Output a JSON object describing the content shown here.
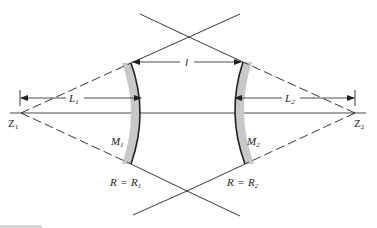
{
  "diagram": {
    "type": "optical resonator (two concave mirrors)",
    "labels": {
      "spacing": "l",
      "L1": "L",
      "L1_sub": "1",
      "L2": "L",
      "L2_sub": "2",
      "Z1": "Z",
      "Z1_sub": "1",
      "Z2": "Z",
      "Z2_sub": "2",
      "M1": "M",
      "M1_sub": "1",
      "M2": "M",
      "M2_sub": "2",
      "R1_left": "R",
      "R1_eq": "=",
      "R1_right": "R",
      "R1_sub": "1",
      "R2_left": "R",
      "R2_eq": "=",
      "R2_right": "R",
      "R2_sub": "2"
    },
    "colors": {
      "line": "#222222",
      "mirror_shade": "#c8c8c8",
      "background": "#ffffff"
    }
  }
}
